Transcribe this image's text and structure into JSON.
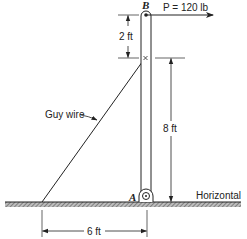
{
  "figure": {
    "type": "statics-free-body-setup",
    "colors": {
      "ink": "#222222",
      "background": "#ffffff"
    }
  },
  "points": {
    "B": {
      "label": "B"
    },
    "A": {
      "label": "A"
    }
  },
  "force": {
    "symbol": "P",
    "label": "P = 120 lb",
    "magnitude": 120,
    "unit": "lb",
    "direction": "horizontal-right"
  },
  "guy_wire": {
    "label": "Guy wire"
  },
  "dimensions": {
    "top_segment": {
      "label": "2 ft",
      "value": 2,
      "unit": "ft"
    },
    "pole_height_to_wire": {
      "label": "8 ft",
      "value": 8,
      "unit": "ft"
    },
    "wire_base_offset": {
      "label": "6 ft",
      "value": 6,
      "unit": "ft"
    }
  },
  "ground": {
    "label": "Horizontal"
  }
}
